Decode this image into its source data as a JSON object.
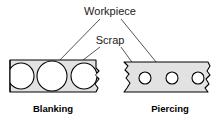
{
  "figure": {
    "title_labels": {
      "workpiece": "Workpiece",
      "scrap": "Scrap"
    },
    "captions": {
      "left": "Blanking",
      "right": "Piercing"
    },
    "colors": {
      "strip_fill": "#e2e2e2",
      "outline": "#000000",
      "hole_fill": "#ffffff",
      "leader_line": "#555555",
      "text": "#1a1a1a",
      "background": "#ffffff"
    },
    "panels": [
      {
        "name": "blanking",
        "caption": "Blanking",
        "description": "Sheet metal strip with large blanked circles; half circles cut at both broken ends",
        "holes": [
          {
            "label": "edge-circle-left",
            "cx": 21,
            "cy": 76,
            "r": 13
          },
          {
            "label": "center-circle",
            "cx": 52,
            "cy": 76,
            "r": 15
          },
          {
            "label": "edge-circle-right",
            "cx": 84,
            "cy": 76,
            "r": 13
          }
        ],
        "callouts": [
          {
            "label": "Scrap",
            "points_to": "strip-web"
          },
          {
            "label": "Workpiece",
            "points_to": "center-circle"
          }
        ]
      },
      {
        "name": "piercing",
        "caption": "Piercing",
        "description": "Sheet metal strip with three small pierced holes; broken ends",
        "holes": [
          {
            "label": "hole-1",
            "cx": 145,
            "cy": 78,
            "r": 6
          },
          {
            "label": "hole-2",
            "cx": 172,
            "cy": 78,
            "r": 6
          },
          {
            "label": "hole-3",
            "cx": 198,
            "cy": 78,
            "r": 6
          }
        ],
        "callouts": [
          {
            "label": "Scrap",
            "points_to": "hole-1"
          },
          {
            "label": "Workpiece",
            "points_to": "strip-web"
          }
        ]
      }
    ]
  }
}
